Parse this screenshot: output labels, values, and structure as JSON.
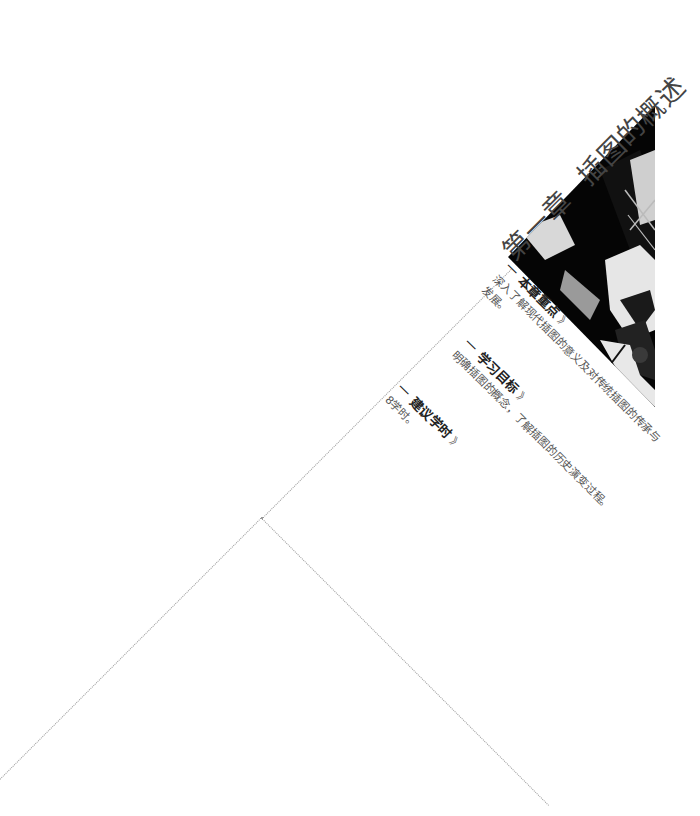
{
  "chapter": {
    "number_label": "第一章",
    "title": "插图的概述"
  },
  "sections": [
    {
      "heading": "本章重点",
      "arrows": "》",
      "lines": [
        "深入了解现代插图的意义及对传统插图的传承与",
        "发展。"
      ]
    },
    {
      "heading": "学习目标",
      "arrows": "》",
      "lines": [
        "明确插图的概念，了解插图的历史演变过程。"
      ]
    },
    {
      "heading": "建议学时",
      "arrows": "》",
      "lines": [
        "8学时。"
      ]
    }
  ],
  "decor": {
    "dash": "一",
    "line_color": "#9a9a9a",
    "photo_desc": "black-and-white illustration triangle"
  }
}
